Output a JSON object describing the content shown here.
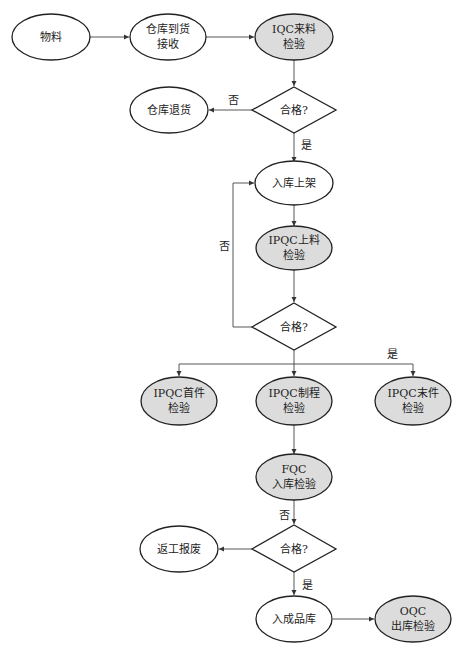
{
  "colors": {
    "plain_fill": "#ffffff",
    "highlight_fill": "#dcdcdc",
    "stroke": "#222222",
    "edge": "#444444"
  },
  "nodes": {
    "material": {
      "lines": [
        "物料"
      ]
    },
    "warehouse_receive": {
      "lines": [
        "仓库到货",
        "接收"
      ]
    },
    "iqc": {
      "lines": [
        "IQC来料",
        "检验"
      ]
    },
    "decision1": {
      "lines": [
        "合格?"
      ]
    },
    "warehouse_return": {
      "lines": [
        "仓库退货"
      ]
    },
    "shelve": {
      "lines": [
        "入库上架"
      ]
    },
    "ipqc_feed": {
      "lines": [
        "IPQC上料",
        "检验"
      ]
    },
    "decision2": {
      "lines": [
        "合格?"
      ]
    },
    "ipqc_first": {
      "lines": [
        "IPQC首件",
        "检验"
      ]
    },
    "ipqc_process": {
      "lines": [
        "IPQC制程",
        "检验"
      ]
    },
    "ipqc_last": {
      "lines": [
        "IPQC末件",
        "检验"
      ]
    },
    "fqc": {
      "lines": [
        "FQC",
        "入库检验"
      ]
    },
    "decision3": {
      "lines": [
        "合格?"
      ]
    },
    "rework_scrap": {
      "lines": [
        "返工报废"
      ]
    },
    "finished_store": {
      "lines": [
        "入成品库"
      ]
    },
    "oqc": {
      "lines": [
        "OQC",
        "出库检验"
      ]
    }
  },
  "edge_labels": {
    "d1_no": "否",
    "d1_yes": "是",
    "d2_no": "否",
    "d2_yes": "是",
    "d3_no": "否",
    "d3_yes": "是"
  }
}
